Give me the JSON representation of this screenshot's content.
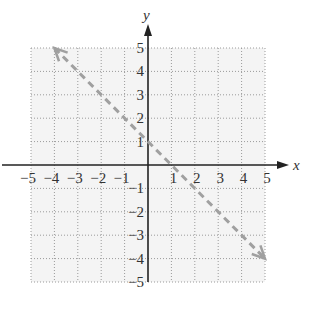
{
  "chart_data": {
    "type": "line",
    "title": "",
    "xlabel": "x",
    "ylabel": "y",
    "xlim": [
      -5,
      5
    ],
    "ylim": [
      -5,
      5
    ],
    "grid": true,
    "x_ticks": [
      -5,
      -4,
      -3,
      -2,
      -1,
      1,
      2,
      3,
      4,
      5
    ],
    "y_ticks": [
      -5,
      -4,
      -3,
      -2,
      -1,
      1,
      2,
      3,
      4,
      5
    ],
    "x_tick_labels": [
      "−5",
      "−4",
      "−3",
      "−2",
      "−1",
      "1",
      "2",
      "3",
      "4",
      "5"
    ],
    "y_tick_labels": [
      "−5",
      "−4",
      "−3",
      "−2",
      "−1",
      "1",
      "2",
      "3",
      "4",
      "5"
    ],
    "series": [
      {
        "name": "y = -x + 1",
        "style": "dashed",
        "arrows": "both",
        "color": "#a0a0a0",
        "x": [
          -4,
          5
        ],
        "y": [
          5,
          -4
        ]
      }
    ],
    "shading": "none"
  },
  "colors": {
    "grid": "#9a9a9a",
    "axis": "#222222",
    "line": "#a0a0a0",
    "background": "#ffffff",
    "plot_fill": "#f4f4f4"
  },
  "layout": {
    "origin_px": [
      148,
      165
    ],
    "unit_px": 23.4
  }
}
